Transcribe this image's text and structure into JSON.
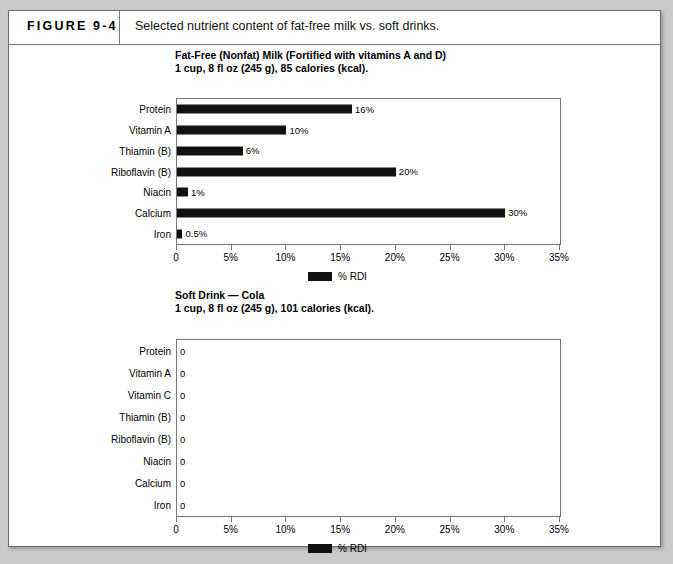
{
  "figure": {
    "number": "FIGURE 9-4",
    "caption": "Selected nutrient content of fat-free milk vs. soft drinks."
  },
  "chart_data": [
    {
      "id": "milk",
      "type": "bar",
      "orientation": "horizontal",
      "title": "Fat-Free (Nonfat) Milk (Fortified with vitamins A and D)",
      "subtitle": "1 cup, 8 fl oz (245 g), 85 calories (kcal).",
      "xlabel": "",
      "ylabel": "",
      "xlim": [
        0,
        35
      ],
      "grid": false,
      "legend_position": "bottom",
      "legend": [
        "% RDI"
      ],
      "series_name": "% RDI",
      "categories": [
        "Protein",
        "Vitamin A",
        "Thiamin (B)",
        "Riboflavin (B)",
        "Niacin",
        "Calcium",
        "Iron"
      ],
      "values": [
        16,
        10,
        6,
        20,
        1,
        30,
        0.5
      ],
      "data_labels": [
        "16%",
        "10%",
        "6%",
        "20%",
        "1%",
        "30%",
        "0.5%"
      ],
      "ticks": [
        0,
        5,
        10,
        15,
        20,
        25,
        30,
        35
      ],
      "tick_labels": [
        "0",
        "5%",
        "10%",
        "15%",
        "20%",
        "25%",
        "30%",
        "35%"
      ]
    },
    {
      "id": "soda",
      "type": "bar",
      "orientation": "horizontal",
      "title": "Soft Drink — Cola",
      "subtitle": "1 cup, 8 fl oz (245 g), 101 calories (kcal).",
      "xlabel": "",
      "ylabel": "",
      "xlim": [
        0,
        35
      ],
      "grid": false,
      "legend_position": "bottom",
      "legend": [
        "% RDI"
      ],
      "series_name": "% RDI",
      "categories": [
        "Protein",
        "Vitamin A",
        "Vitamin C",
        "Thiamin (B)",
        "Riboflavin (B)",
        "Niacin",
        "Calcium",
        "Iron"
      ],
      "values": [
        0,
        0,
        0,
        0,
        0,
        0,
        0,
        0
      ],
      "data_labels": [
        "0",
        "0",
        "0",
        "0",
        "0",
        "0",
        "0",
        "0"
      ],
      "ticks": [
        0,
        5,
        10,
        15,
        20,
        25,
        30,
        35
      ],
      "tick_labels": [
        "0",
        "5%",
        "10%",
        "15%",
        "20%",
        "25%",
        "30%",
        "35%"
      ]
    }
  ],
  "colors": {
    "bar": "#111111",
    "frame": "#777777",
    "page": "#ffffff",
    "backdrop": "#c9c9c9"
  }
}
